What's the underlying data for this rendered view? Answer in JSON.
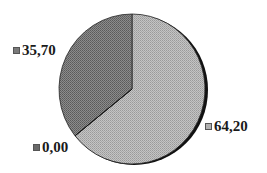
{
  "chart_data": {
    "type": "pie",
    "title": "",
    "categories": [
      "64,20",
      "35,70",
      "0,00"
    ],
    "values": [
      64.2,
      35.7,
      0.0
    ],
    "labels": [
      "64,20",
      "35,70",
      "0,00"
    ],
    "colors": [
      "#b4b4b4",
      "#7e7e7e",
      "#6a6a6a"
    ],
    "start_angle_deg": 0,
    "direction": "counterclockwise-from-top for 35,70 slice",
    "legend_position": "inline labels"
  },
  "labels": {
    "a": "35,70",
    "b": "0,00",
    "c": "64,20"
  }
}
